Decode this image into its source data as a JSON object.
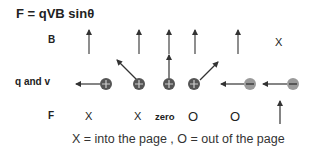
{
  "title": "F = qVB sinθ",
  "rows": {
    "b_label": "B",
    "qv_label": "q and v",
    "f_label": "F"
  },
  "b_column_extra": "X",
  "charges": [
    {
      "sign": "+",
      "velocity": "left",
      "B": "up",
      "F": "X"
    },
    {
      "sign": "+",
      "velocity": "up-left",
      "B": "up",
      "F": "X"
    },
    {
      "sign": "+",
      "velocity": "up",
      "B": "up",
      "F": "zero"
    },
    {
      "sign": "+",
      "velocity": "up-right",
      "B": "up",
      "F": "O"
    },
    {
      "sign": "-",
      "velocity": "left",
      "B": "up",
      "F": "O"
    },
    {
      "sign": "-",
      "velocity": "left",
      "B": "X",
      "F": "↑"
    }
  ],
  "forces": [
    "X",
    "X",
    "zero",
    "O",
    "O"
  ],
  "caption": "X = into the page , O = out of the page",
  "colors": {
    "positive_charge": "#555555",
    "negative_charge": "#9a9a9a",
    "arrow": "#333333"
  }
}
